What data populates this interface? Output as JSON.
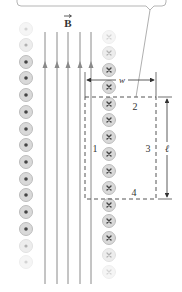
{
  "figure": {
    "field_label": "B",
    "field_vector_arrow": true,
    "width_label": "w",
    "length_label": "ℓ",
    "side_labels": [
      "1",
      "2",
      "3",
      "4"
    ],
    "callout": {
      "text": ""
    },
    "left_column_symbol": "dot",
    "right_column_symbol": "cross",
    "colors": {
      "field_line": "#8a8a8a",
      "circle_fill": "#d9d9d9",
      "circle_ring": "#bdbdbd",
      "symbol": "#555555",
      "dashed_loop": "#555555",
      "dimension": "#333333",
      "callout_border": "#b5b5b5"
    }
  }
}
